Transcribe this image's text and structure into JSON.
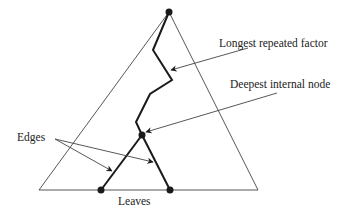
{
  "diagram": {
    "labels": {
      "longest_repeated_factor": "Longest repeated factor",
      "deepest_internal_node": "Deepest internal node",
      "edges": "Edges",
      "leaves": "Leaves"
    },
    "nodes": [
      {
        "id": "root",
        "x": 169,
        "y": 12
      },
      {
        "id": "deepest-internal-node",
        "x": 142,
        "y": 135
      },
      {
        "id": "leaf-left",
        "x": 101,
        "y": 190
      },
      {
        "id": "leaf-right",
        "x": 170,
        "y": 190
      }
    ],
    "colors": {
      "stroke": "#1a1a1a",
      "thin": "#444444"
    }
  }
}
